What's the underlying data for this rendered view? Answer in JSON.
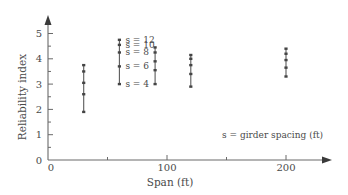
{
  "chart_data": {
    "type": "scatter",
    "title": "",
    "xlabel": "Span (ft)",
    "ylabel": "Reliability index",
    "xlim": [
      0,
      235
    ],
    "ylim": [
      0,
      5.5
    ],
    "x_ticks_major": [
      0,
      100,
      200
    ],
    "x_ticks_minor": [
      50,
      150
    ],
    "x_tick_labels": [
      "0",
      "100",
      "200"
    ],
    "y_ticks_major": [
      0,
      1,
      2,
      3,
      4,
      5
    ],
    "y_tick_labels": [
      "0",
      "1",
      "2",
      "3",
      "4",
      "5"
    ],
    "y_ticks_minor": [
      0.5,
      1.5,
      2.5,
      3.5,
      4.5
    ],
    "grid": false,
    "series_note": "Each vertical group connects points for girder spacing s = 12, 10, 8, 6, 4 ft (top to bottom)",
    "groups": [
      {
        "span": 30,
        "values": [
          3.75,
          3.5,
          3.05,
          2.6,
          1.9
        ]
      },
      {
        "span": 60,
        "values": [
          4.75,
          4.55,
          4.25,
          3.7,
          3.0
        ]
      },
      {
        "span": 90,
        "values": [
          4.45,
          4.25,
          3.9,
          3.55,
          3.0
        ]
      },
      {
        "span": 120,
        "values": [
          4.15,
          4.0,
          3.75,
          3.4,
          2.9
        ]
      },
      {
        "span": 200,
        "values": [
          4.4,
          4.2,
          3.95,
          3.65,
          3.3
        ]
      }
    ],
    "spacing_labels": [
      "s = 12",
      "s = 10",
      "s = 8",
      "s = 6",
      "s = 4"
    ],
    "annotation": "s = girder spacing (ft)"
  }
}
